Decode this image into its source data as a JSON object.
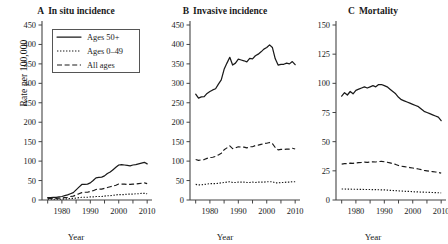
{
  "figure": {
    "ylabel": "Rate per 100,000",
    "xlabel": "Year"
  },
  "legend": {
    "items": [
      {
        "label": "Ages 50+",
        "style": "solid"
      },
      {
        "label": "Ages 0–49",
        "style": "dotted"
      },
      {
        "label": "All ages",
        "style": "dashed"
      }
    ]
  },
  "panels": [
    {
      "letter": "A",
      "title": "In situ incidence"
    },
    {
      "letter": "B",
      "title": "Invasive incidence"
    },
    {
      "letter": "C",
      "title": "Mortality"
    }
  ],
  "chart_data": [
    {
      "type": "line",
      "panel": "A",
      "title": "In situ incidence",
      "xlabel": "Year",
      "ylabel": "Rate per 100,000",
      "xlim": [
        1973,
        2011
      ],
      "ylim": [
        0,
        450
      ],
      "yticks": [
        0,
        50,
        100,
        150,
        200,
        250,
        300,
        350,
        400,
        450
      ],
      "xticks": [
        1975,
        1980,
        1985,
        1990,
        1995,
        2000,
        2005,
        2010
      ],
      "xticklabels": [
        "",
        "1980",
        "",
        "1990",
        "",
        "2000",
        "",
        "2010"
      ],
      "grid": false,
      "legend_position": "upper left",
      "x": [
        1975,
        1976,
        1977,
        1978,
        1979,
        1980,
        1981,
        1982,
        1983,
        1984,
        1985,
        1986,
        1987,
        1988,
        1989,
        1990,
        1991,
        1992,
        1993,
        1994,
        1995,
        1996,
        1997,
        1998,
        1999,
        2000,
        2001,
        2002,
        2003,
        2004,
        2005,
        2006,
        2007,
        2008,
        2009,
        2010
      ],
      "series": [
        {
          "name": "Ages 50+",
          "style": "solid",
          "values": [
            6,
            6,
            7,
            7,
            8,
            9,
            11,
            13,
            16,
            19,
            26,
            33,
            40,
            40,
            41,
            44,
            50,
            57,
            58,
            59,
            62,
            68,
            72,
            78,
            84,
            90,
            91,
            90,
            89,
            88,
            90,
            91,
            93,
            95,
            97,
            93
          ]
        },
        {
          "name": "Ages 0–49",
          "style": "dotted",
          "values": [
            2,
            2,
            2,
            2,
            2,
            2,
            3,
            3,
            4,
            4,
            5,
            6,
            7,
            7,
            7,
            8,
            8,
            9,
            9,
            9,
            10,
            11,
            11,
            12,
            13,
            14,
            14,
            14,
            15,
            15,
            15,
            16,
            16,
            17,
            17,
            16
          ]
        },
        {
          "name": "All ages",
          "style": "dashed",
          "values": [
            4,
            4,
            4,
            4,
            5,
            5,
            6,
            7,
            9,
            10,
            13,
            16,
            19,
            20,
            20,
            22,
            24,
            27,
            28,
            28,
            30,
            32,
            34,
            36,
            38,
            41,
            41,
            41,
            40,
            40,
            41,
            41,
            42,
            43,
            44,
            42
          ]
        }
      ]
    },
    {
      "type": "line",
      "panel": "B",
      "title": "Invasive incidence",
      "xlabel": "Year",
      "ylabel": "Rate per 100,000",
      "xlim": [
        1973,
        2011
      ],
      "ylim": [
        0,
        450
      ],
      "yticks": [
        0,
        50,
        100,
        150,
        200,
        250,
        300,
        350,
        400,
        450
      ],
      "xticks": [
        1975,
        1980,
        1985,
        1990,
        1995,
        2000,
        2005,
        2010
      ],
      "xticklabels": [
        "",
        "1980",
        "",
        "1990",
        "",
        "2000",
        "",
        "2010"
      ],
      "grid": false,
      "legend_position": "none",
      "x": [
        1975,
        1976,
        1977,
        1978,
        1979,
        1980,
        1981,
        1982,
        1983,
        1984,
        1985,
        1986,
        1987,
        1988,
        1989,
        1990,
        1991,
        1992,
        1993,
        1994,
        1995,
        1996,
        1997,
        1998,
        1999,
        2000,
        2001,
        2002,
        2003,
        2004,
        2005,
        2006,
        2007,
        2008,
        2009,
        2010
      ],
      "series": [
        {
          "name": "Ages 50+",
          "style": "solid",
          "values": [
            272,
            262,
            265,
            266,
            274,
            279,
            283,
            286,
            298,
            309,
            336,
            352,
            367,
            347,
            352,
            362,
            360,
            358,
            355,
            364,
            363,
            371,
            375,
            381,
            388,
            392,
            399,
            392,
            363,
            347,
            349,
            349,
            352,
            350,
            356,
            348
          ]
        },
        {
          "name": "Ages 0–49",
          "style": "dotted",
          "values": [
            40,
            39,
            39,
            40,
            41,
            42,
            42,
            42,
            43,
            44,
            45,
            46,
            47,
            45,
            45,
            46,
            46,
            46,
            45,
            45,
            46,
            45,
            46,
            46,
            46,
            47,
            47,
            47,
            44,
            44,
            45,
            45,
            46,
            46,
            47,
            47
          ]
        },
        {
          "name": "All ages",
          "style": "dashed",
          "values": [
            104,
            102,
            103,
            104,
            107,
            109,
            110,
            112,
            116,
            120,
            129,
            134,
            139,
            132,
            134,
            137,
            136,
            136,
            134,
            137,
            137,
            140,
            141,
            143,
            145,
            146,
            148,
            145,
            135,
            129,
            130,
            130,
            131,
            131,
            133,
            131
          ]
        }
      ]
    },
    {
      "type": "line",
      "panel": "C",
      "title": "Mortality",
      "xlabel": "Year",
      "ylabel": "Rate per 100,000",
      "xlim": [
        1973,
        2011
      ],
      "ylim": [
        0,
        150
      ],
      "yticks": [
        0,
        25,
        50,
        75,
        100,
        125,
        150
      ],
      "xticks": [
        1975,
        1980,
        1985,
        1990,
        1995,
        2000,
        2005,
        2010
      ],
      "xticklabels": [
        "",
        "1980",
        "",
        "1990",
        "",
        "2000",
        "",
        "2010"
      ],
      "grid": false,
      "legend_position": "none",
      "x": [
        1975,
        1976,
        1977,
        1978,
        1979,
        1980,
        1981,
        1982,
        1983,
        1984,
        1985,
        1986,
        1987,
        1988,
        1989,
        1990,
        1991,
        1992,
        1993,
        1994,
        1995,
        1996,
        1997,
        1998,
        1999,
        2000,
        2001,
        2002,
        2003,
        2004,
        2005,
        2006,
        2007,
        2008,
        2009,
        2010
      ],
      "series": [
        {
          "name": "Ages 50+",
          "style": "solid",
          "values": [
            89,
            92,
            90,
            93,
            91,
            94,
            95,
            96,
            97,
            96,
            97,
            98,
            97,
            99,
            99,
            98,
            97,
            95,
            93,
            91,
            88,
            86,
            85,
            84,
            83,
            82,
            81,
            80,
            78,
            76,
            75,
            74,
            73,
            72,
            71,
            68
          ]
        },
        {
          "name": "Ages 0–49",
          "style": "dotted",
          "values": [
            9.4,
            9.4,
            9.3,
            9.3,
            9.2,
            9.2,
            9.1,
            9.1,
            9.0,
            9.0,
            9.0,
            8.9,
            8.9,
            8.8,
            8.7,
            8.7,
            8.5,
            8.3,
            8.1,
            8.0,
            7.8,
            7.7,
            7.5,
            7.4,
            7.3,
            7.1,
            7.0,
            6.9,
            6.8,
            6.7,
            6.6,
            6.5,
            6.4,
            6.3,
            6.2,
            6.1
          ]
        },
        {
          "name": "All ages",
          "style": "dashed",
          "values": [
            30.8,
            31.2,
            31.1,
            31.6,
            31.4,
            31.8,
            32.0,
            32.2,
            32.5,
            32.3,
            32.5,
            32.7,
            32.6,
            33.0,
            33.1,
            32.8,
            32.4,
            31.8,
            31.2,
            30.5,
            29.6,
            29.0,
            28.6,
            28.2,
            27.8,
            27.4,
            27.0,
            26.6,
            26.0,
            25.4,
            25.0,
            24.6,
            24.3,
            24.0,
            23.6,
            23.0
          ]
        }
      ]
    }
  ]
}
